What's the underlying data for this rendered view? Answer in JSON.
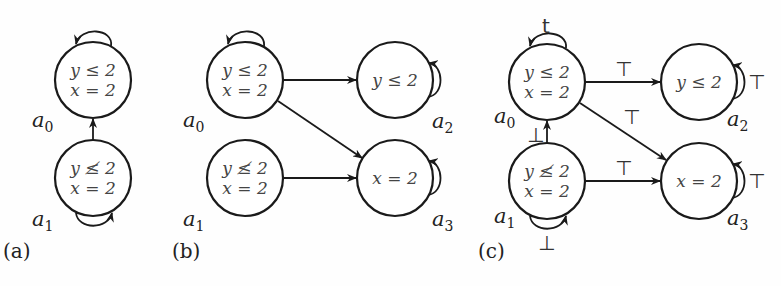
{
  "figure": {
    "panels": [
      {
        "id": "a",
        "label": "(a)",
        "states": [
          {
            "name": "a0",
            "letter": "a",
            "index": "0",
            "line1": "y ≤ 2",
            "line2": "x = 2"
          },
          {
            "name": "a1",
            "letter": "a",
            "index": "1",
            "line1": "y ≰ 2",
            "line2": "x = 2"
          }
        ],
        "edges": [
          {
            "from": "a0",
            "to": "a0",
            "type": "self-loop"
          },
          {
            "from": "a1",
            "to": "a1",
            "type": "self-loop"
          },
          {
            "from": "a1",
            "to": "a0"
          }
        ]
      },
      {
        "id": "b",
        "label": "(b)",
        "states": [
          {
            "name": "a0",
            "letter": "a",
            "index": "0",
            "line1": "y ≤ 2",
            "line2": "x = 2"
          },
          {
            "name": "a1",
            "letter": "a",
            "index": "1",
            "line1": "y ≰ 2",
            "line2": "x = 2"
          },
          {
            "name": "a2",
            "letter": "a",
            "index": "2",
            "line1": "y ≤ 2"
          },
          {
            "name": "a3",
            "letter": "a",
            "index": "3",
            "line1": "x = 2"
          }
        ],
        "edges": [
          {
            "from": "a0",
            "to": "a0",
            "type": "self-loop"
          },
          {
            "from": "a0",
            "to": "a2"
          },
          {
            "from": "a0",
            "to": "a3"
          },
          {
            "from": "a1",
            "to": "a3"
          },
          {
            "from": "a2",
            "to": "a2",
            "type": "self-loop"
          },
          {
            "from": "a3",
            "to": "a3",
            "type": "self-loop"
          }
        ]
      },
      {
        "id": "c",
        "label": "(c)",
        "states": [
          {
            "name": "a0",
            "letter": "a",
            "index": "0",
            "line1": "y ≤ 2",
            "line2": "x = 2"
          },
          {
            "name": "a1",
            "letter": "a",
            "index": "1",
            "line1": "y ≰ 2",
            "line2": "x = 2"
          },
          {
            "name": "a2",
            "letter": "a",
            "index": "2",
            "line1": "y ≤ 2"
          },
          {
            "name": "a3",
            "letter": "a",
            "index": "3",
            "line1": "x = 2"
          }
        ],
        "edges": [
          {
            "from": "a0",
            "to": "a0",
            "type": "self-loop",
            "label": "t"
          },
          {
            "from": "a0",
            "to": "a2",
            "label": "⊤"
          },
          {
            "from": "a0",
            "to": "a3",
            "label": "⊤"
          },
          {
            "from": "a1",
            "to": "a0",
            "label": "⊥"
          },
          {
            "from": "a1",
            "to": "a1",
            "type": "self-loop",
            "label": "⊥"
          },
          {
            "from": "a1",
            "to": "a3",
            "label": "⊤"
          },
          {
            "from": "a2",
            "to": "a2",
            "type": "self-loop",
            "label": "⊤"
          },
          {
            "from": "a3",
            "to": "a3",
            "type": "self-loop",
            "label": "⊤"
          }
        ]
      }
    ]
  },
  "colors": {
    "stroke": "#1a1a1a",
    "text": "#444444",
    "background": "#ffffff"
  }
}
